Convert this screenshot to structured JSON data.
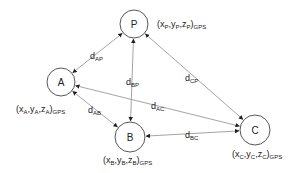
{
  "diagram": {
    "colors": {
      "node_stroke": "#444444",
      "edge_stroke": "#9a9a9a",
      "arrow": "#222222",
      "text": "#222222"
    },
    "nodes": [
      {
        "id": "P",
        "label": "P",
        "cx": 134,
        "cy": 24,
        "r": 14,
        "coord": {
          "x": "x",
          "y": "y",
          "z": "z",
          "sub": "P",
          "frame": "GPS"
        },
        "coord_pos": [
          157,
          27
        ]
      },
      {
        "id": "A",
        "label": "A",
        "cx": 61,
        "cy": 82,
        "r": 14,
        "coord": {
          "x": "x",
          "y": "y",
          "z": "z",
          "sub": "A",
          "frame": "GPS"
        },
        "coord_pos": [
          16,
          112
        ]
      },
      {
        "id": "B",
        "label": "B",
        "cx": 130,
        "cy": 137,
        "r": 15,
        "coord": {
          "x": "x",
          "y": "y",
          "z": "z",
          "sub": "B",
          "frame": "GPS"
        },
        "coord_pos": [
          103,
          163
        ]
      },
      {
        "id": "C",
        "label": "C",
        "cx": 255,
        "cy": 130,
        "r": 15,
        "coord": {
          "x": "x",
          "y": "y",
          "z": "z",
          "sub": "C",
          "frame": "GPS"
        },
        "coord_pos": [
          232,
          157
        ]
      }
    ],
    "edges": [
      {
        "id": "AP",
        "from": "A",
        "to": "P",
        "label": "d",
        "sub": "AP",
        "label_pos": [
          90,
          59
        ]
      },
      {
        "id": "BP",
        "from": "B",
        "to": "P",
        "label": "d",
        "sub": "BP",
        "label_pos": [
          126,
          85
        ]
      },
      {
        "id": "CP",
        "from": "C",
        "to": "P",
        "label": "d",
        "sub": "CP",
        "label_pos": [
          185,
          81
        ]
      },
      {
        "id": "AC",
        "from": "A",
        "to": "C",
        "label": "d",
        "sub": "AC",
        "label_pos": [
          151,
          109
        ]
      },
      {
        "id": "AB",
        "from": "A",
        "to": "B",
        "label": "d",
        "sub": "AB",
        "label_pos": [
          88,
          113
        ]
      },
      {
        "id": "BC",
        "from": "B",
        "to": "C",
        "label": "d",
        "sub": "BC",
        "label_pos": [
          185,
          138
        ]
      }
    ]
  }
}
